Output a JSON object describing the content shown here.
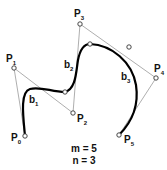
{
  "diagram": {
    "colors": {
      "curve": "#000000",
      "polygon": "#999999",
      "point_stroke": "#333333",
      "text": "#111111"
    },
    "control_points": [
      {
        "id": "P0",
        "letter": "P",
        "sub": "0",
        "x": 25,
        "y": 136,
        "lx": 11,
        "ly": 141
      },
      {
        "id": "P1",
        "letter": "P",
        "sub": "1",
        "x": 14,
        "y": 68,
        "lx": 6,
        "ly": 62
      },
      {
        "id": "P2",
        "letter": "P",
        "sub": "2",
        "x": 73,
        "y": 113,
        "lx": 77,
        "ly": 122
      },
      {
        "id": "P3",
        "letter": "P",
        "sub": "3",
        "x": 80,
        "y": 24,
        "lx": 74,
        "ly": 17
      },
      {
        "id": "P4",
        "letter": "P",
        "sub": "4",
        "x": 156,
        "y": 78,
        "lx": 154,
        "ly": 72
      },
      {
        "id": "P5",
        "letter": "P",
        "sub": "5",
        "x": 119,
        "y": 135,
        "lx": 124,
        "ly": 143
      }
    ],
    "knots": [
      {
        "x": 65,
        "y": 92
      },
      {
        "x": 90,
        "y": 44
      },
      {
        "x": 129,
        "y": 47
      }
    ],
    "segments": [
      {
        "id": "b1",
        "letter": "b",
        "sub": "1",
        "lx": 29,
        "ly": 103
      },
      {
        "id": "b2",
        "letter": "b",
        "sub": "2",
        "lx": 64,
        "ly": 68
      },
      {
        "id": "b3",
        "letter": "b",
        "sub": "3",
        "lx": 121,
        "ly": 80
      }
    ],
    "caption": {
      "m_line": "m = 5",
      "n_line": "n = 3"
    }
  }
}
